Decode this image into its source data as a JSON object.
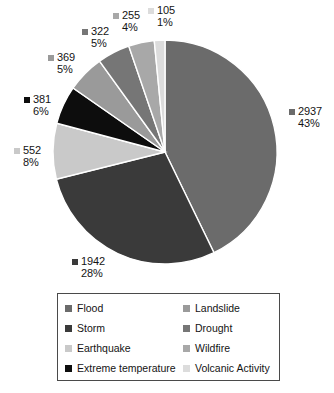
{
  "chart_data": {
    "type": "pie",
    "title": "",
    "total": 6863,
    "start_angle_deg": 0,
    "direction": "clockwise",
    "legend_position": "bottom",
    "categories": [
      "Flood",
      "Storm",
      "Earthquake",
      "Extreme temperature",
      "Landslide",
      "Drought",
      "Wildfire",
      "Volcanic Activity"
    ],
    "values": [
      2937,
      1942,
      552,
      381,
      369,
      322,
      255,
      105
    ],
    "percentages": [
      43,
      28,
      8,
      6,
      5,
      5,
      4,
      1
    ],
    "colors": [
      "#6b6b6b",
      "#3a3a3a",
      "#c9c9c9",
      "#0d0d0d",
      "#9a9a9a",
      "#767676",
      "#a8a8a8",
      "#dcdcdc"
    ],
    "slices": [
      {
        "label": "Flood",
        "value": 2937,
        "percent": 43,
        "value_text": "2937",
        "percent_text": "43%",
        "color": "#6b6b6b"
      },
      {
        "label": "Storm",
        "value": 1942,
        "percent": 28,
        "value_text": "1942",
        "percent_text": "28%",
        "color": "#3a3a3a"
      },
      {
        "label": "Earthquake",
        "value": 552,
        "percent": 8,
        "value_text": "552",
        "percent_text": "8%",
        "color": "#c9c9c9"
      },
      {
        "label": "Extreme temperature",
        "value": 381,
        "percent": 6,
        "value_text": "381",
        "percent_text": "6%",
        "color": "#0d0d0d"
      },
      {
        "label": "Landslide",
        "value": 369,
        "percent": 5,
        "value_text": "369",
        "percent_text": "5%",
        "color": "#9a9a9a"
      },
      {
        "label": "Drought",
        "value": 322,
        "percent": 5,
        "value_text": "322",
        "percent_text": "5%",
        "color": "#767676"
      },
      {
        "label": "Wildfire",
        "value": 255,
        "percent": 4,
        "value_text": "255",
        "percent_text": "4%",
        "color": "#a8a8a8"
      },
      {
        "label": "Volcanic Activity",
        "value": 105,
        "percent": 1,
        "value_text": "105",
        "percent_text": "1%",
        "color": "#dcdcdc"
      }
    ]
  },
  "legend": {
    "items": [
      {
        "label": "Flood",
        "color": "#6b6b6b"
      },
      {
        "label": "Landslide",
        "color": "#9a9a9a"
      },
      {
        "label": "Storm",
        "color": "#3a3a3a"
      },
      {
        "label": "Drought",
        "color": "#767676"
      },
      {
        "label": "Earthquake",
        "color": "#c9c9c9"
      },
      {
        "label": "Wildfire",
        "color": "#a8a8a8"
      },
      {
        "label": "Extreme temperature",
        "color": "#0d0d0d"
      },
      {
        "label": "Volcanic Activity",
        "color": "#dcdcdc"
      }
    ]
  }
}
